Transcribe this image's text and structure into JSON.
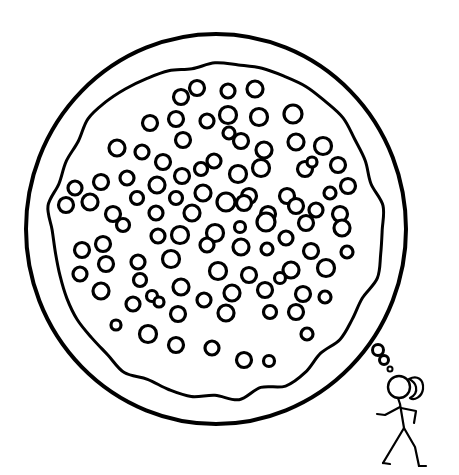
{
  "canvas": {
    "width": 459,
    "height": 475,
    "background_color": "#FFFFFF",
    "ink_color": "#000000",
    "title": "Stick figure thinking about a pizza"
  },
  "illustration": {
    "style": "black and white line art",
    "description": "A large round thought bubble containing a pizza covered in many round toppings, connected by a trail of three shrinking bubbles to a walking stick figure girl with a ponytail."
  },
  "thought_bubble": {
    "name": "thought-bubble-outline",
    "shape": "circle",
    "center_x": 216,
    "center_y": 229,
    "radius_x": 190,
    "radius_y": 195,
    "stroke_width": 4,
    "stroke_color": "#000000",
    "fill_color": "#FFFFFF"
  },
  "pizza": {
    "name": "pizza-crust",
    "shape": "irregular-blob",
    "center_x": 215,
    "center_y": 230,
    "radius": 165,
    "stroke_width": 3,
    "stroke_color": "#000000",
    "fill_color": "#FFFFFF",
    "wobble_points": 44,
    "topping_count": 92,
    "topping_stroke_width": 3.2,
    "topping_fill_color": "#FFFFFF",
    "topping_stroke_color": "#000000"
  },
  "toppings": [
    {
      "cx": 197,
      "cy": 88,
      "r": 7.5
    },
    {
      "cx": 228,
      "cy": 91,
      "r": 7.0
    },
    {
      "cx": 255,
      "cy": 89,
      "r": 8.0
    },
    {
      "cx": 181,
      "cy": 97,
      "r": 7.5
    },
    {
      "cx": 150,
      "cy": 123,
      "r": 7.5
    },
    {
      "cx": 176,
      "cy": 119,
      "r": 7.5
    },
    {
      "cx": 207,
      "cy": 121,
      "r": 7.0
    },
    {
      "cx": 228,
      "cy": 115,
      "r": 8.5
    },
    {
      "cx": 229,
      "cy": 133,
      "r": 6.0
    },
    {
      "cx": 259,
      "cy": 117,
      "r": 8.5
    },
    {
      "cx": 293,
      "cy": 114,
      "r": 9.0
    },
    {
      "cx": 117,
      "cy": 148,
      "r": 8.0
    },
    {
      "cx": 142,
      "cy": 152,
      "r": 7.0
    },
    {
      "cx": 183,
      "cy": 140,
      "r": 7.5
    },
    {
      "cx": 241,
      "cy": 141,
      "r": 7.5
    },
    {
      "cx": 264,
      "cy": 150,
      "r": 8.0
    },
    {
      "cx": 296,
      "cy": 142,
      "r": 8.0
    },
    {
      "cx": 323,
      "cy": 146,
      "r": 8.5
    },
    {
      "cx": 163,
      "cy": 162,
      "r": 7.5
    },
    {
      "cx": 214,
      "cy": 161,
      "r": 7.0
    },
    {
      "cx": 101,
      "cy": 182,
      "r": 7.5
    },
    {
      "cx": 127,
      "cy": 178,
      "r": 7.0
    },
    {
      "cx": 157,
      "cy": 185,
      "r": 8.0
    },
    {
      "cx": 182,
      "cy": 176,
      "r": 7.5
    },
    {
      "cx": 201,
      "cy": 169,
      "r": 6.5
    },
    {
      "cx": 238,
      "cy": 174,
      "r": 8.5
    },
    {
      "cx": 261,
      "cy": 168,
      "r": 8.5
    },
    {
      "cx": 305,
      "cy": 169,
      "r": 7.5
    },
    {
      "cx": 312,
      "cy": 162,
      "r": 5.0
    },
    {
      "cx": 338,
      "cy": 165,
      "r": 7.5
    },
    {
      "cx": 75,
      "cy": 188,
      "r": 7.0
    },
    {
      "cx": 90,
      "cy": 202,
      "r": 8.0
    },
    {
      "cx": 137,
      "cy": 198,
      "r": 6.5
    },
    {
      "cx": 176,
      "cy": 198,
      "r": 6.5
    },
    {
      "cx": 203,
      "cy": 193,
      "r": 8.0
    },
    {
      "cx": 249,
      "cy": 196,
      "r": 7.5
    },
    {
      "cx": 287,
      "cy": 196,
      "r": 7.5
    },
    {
      "cx": 330,
      "cy": 193,
      "r": 6.0
    },
    {
      "cx": 348,
      "cy": 186,
      "r": 7.5
    },
    {
      "cx": 66,
      "cy": 205,
      "r": 7.5
    },
    {
      "cx": 113,
      "cy": 214,
      "r": 7.5
    },
    {
      "cx": 156,
      "cy": 213,
      "r": 7.0
    },
    {
      "cx": 192,
      "cy": 213,
      "r": 8.0
    },
    {
      "cx": 226,
      "cy": 202,
      "r": 9.0
    },
    {
      "cx": 244,
      "cy": 203,
      "r": 7.5
    },
    {
      "cx": 268,
      "cy": 214,
      "r": 7.5
    },
    {
      "cx": 296,
      "cy": 206,
      "r": 7.5
    },
    {
      "cx": 316,
      "cy": 210,
      "r": 7.0
    },
    {
      "cx": 340,
      "cy": 214,
      "r": 7.5
    },
    {
      "cx": 123,
      "cy": 225,
      "r": 6.5
    },
    {
      "cx": 215,
      "cy": 233,
      "r": 8.5
    },
    {
      "cx": 240,
      "cy": 227,
      "r": 5.5
    },
    {
      "cx": 266,
      "cy": 222,
      "r": 9.0
    },
    {
      "cx": 306,
      "cy": 223,
      "r": 7.5
    },
    {
      "cx": 342,
      "cy": 228,
      "r": 8.0
    },
    {
      "cx": 82,
      "cy": 250,
      "r": 7.5
    },
    {
      "cx": 103,
      "cy": 244,
      "r": 7.5
    },
    {
      "cx": 158,
      "cy": 236,
      "r": 7.0
    },
    {
      "cx": 180,
      "cy": 235,
      "r": 8.5
    },
    {
      "cx": 207,
      "cy": 245,
      "r": 7.0
    },
    {
      "cx": 241,
      "cy": 247,
      "r": 8.0
    },
    {
      "cx": 267,
      "cy": 249,
      "r": 6.0
    },
    {
      "cx": 286,
      "cy": 238,
      "r": 7.0
    },
    {
      "cx": 311,
      "cy": 251,
      "r": 7.5
    },
    {
      "cx": 347,
      "cy": 252,
      "r": 6.0
    },
    {
      "cx": 106,
      "cy": 264,
      "r": 7.5
    },
    {
      "cx": 138,
      "cy": 262,
      "r": 7.0
    },
    {
      "cx": 171,
      "cy": 259,
      "r": 8.5
    },
    {
      "cx": 218,
      "cy": 271,
      "r": 8.5
    },
    {
      "cx": 249,
      "cy": 275,
      "r": 7.5
    },
    {
      "cx": 291,
      "cy": 270,
      "r": 8.0
    },
    {
      "cx": 326,
      "cy": 268,
      "r": 8.5
    },
    {
      "cx": 80,
      "cy": 274,
      "r": 7.0
    },
    {
      "cx": 101,
      "cy": 291,
      "r": 8.0
    },
    {
      "cx": 140,
      "cy": 280,
      "r": 6.5
    },
    {
      "cx": 181,
      "cy": 287,
      "r": 8.0
    },
    {
      "cx": 204,
      "cy": 300,
      "r": 7.0
    },
    {
      "cx": 232,
      "cy": 293,
      "r": 8.0
    },
    {
      "cx": 265,
      "cy": 290,
      "r": 7.5
    },
    {
      "cx": 280,
      "cy": 278,
      "r": 5.5
    },
    {
      "cx": 303,
      "cy": 294,
      "r": 7.5
    },
    {
      "cx": 325,
      "cy": 297,
      "r": 6.0
    },
    {
      "cx": 133,
      "cy": 304,
      "r": 7.0
    },
    {
      "cx": 152,
      "cy": 296,
      "r": 5.5
    },
    {
      "cx": 159,
      "cy": 302,
      "r": 5.0
    },
    {
      "cx": 178,
      "cy": 314,
      "r": 7.5
    },
    {
      "cx": 226,
      "cy": 313,
      "r": 8.0
    },
    {
      "cx": 270,
      "cy": 312,
      "r": 6.5
    },
    {
      "cx": 296,
      "cy": 312,
      "r": 7.5
    },
    {
      "cx": 116,
      "cy": 325,
      "r": 5.0
    },
    {
      "cx": 148,
      "cy": 334,
      "r": 8.5
    },
    {
      "cx": 176,
      "cy": 345,
      "r": 7.5
    },
    {
      "cx": 212,
      "cy": 348,
      "r": 7.0
    },
    {
      "cx": 244,
      "cy": 360,
      "r": 7.5
    },
    {
      "cx": 269,
      "cy": 361,
      "r": 5.5
    },
    {
      "cx": 307,
      "cy": 334,
      "r": 6.0
    }
  ],
  "bubble_trail": {
    "name": "thought-bubble-trail",
    "bubbles": [
      {
        "cx": 378,
        "cy": 350,
        "r": 5.5,
        "stroke_width": 3
      },
      {
        "cx": 384,
        "cy": 360,
        "r": 4.5,
        "stroke_width": 3
      },
      {
        "cx": 390,
        "cy": 369,
        "r": 2.5,
        "stroke_width": 2
      }
    ]
  },
  "stick_figure": {
    "name": "stick-figure-girl",
    "description": "walking girl with ponytail",
    "stroke_color": "#000000",
    "stroke_width": 2,
    "head": {
      "cx": 399,
      "cy": 387,
      "r": 11
    },
    "ponytail": "curved hair tail behind head",
    "pose": "mid-stride walking to the right"
  },
  "labels": {
    "scene_alt": "Stick figure girl walking while thinking about a pizza"
  }
}
